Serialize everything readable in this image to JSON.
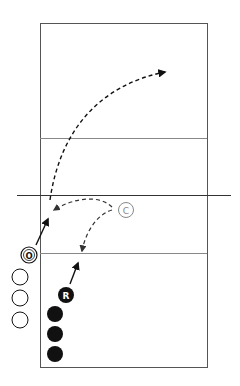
{
  "diagram": {
    "type": "volleyball-court-drill",
    "colors": {
      "court_line": "#555555",
      "net": "#333333",
      "arrow": "#111111",
      "coach": "#888888",
      "player_dark": "#111111",
      "player_light": "#ffffff"
    },
    "markers": {
      "coach": {
        "label": "C"
      },
      "offensive": {
        "label": "O"
      },
      "receiver": {
        "label": "R"
      },
      "waiting_light_count": 3,
      "waiting_dark_count": 3
    }
  }
}
